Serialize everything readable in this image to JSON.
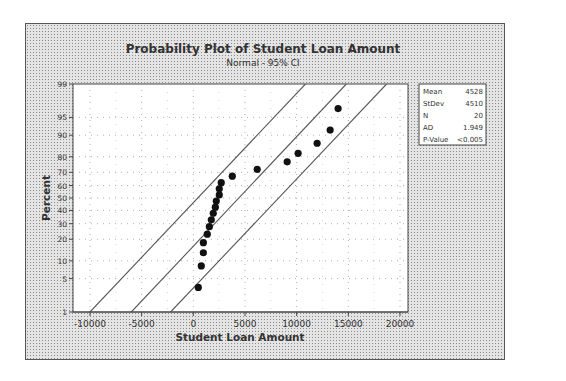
{
  "chart_data": {
    "type": "scatter",
    "title": "Probability Plot of Student Loan Amount",
    "subtitle": "Normal - 95% CI",
    "xlabel": "Student Loan Amount",
    "ylabel": "Percent",
    "xlim": [
      -11000,
      21000
    ],
    "ylim": [
      1,
      99
    ],
    "x_ticks": [
      -10000,
      -5000,
      0,
      5000,
      10000,
      15000,
      20000
    ],
    "x_tick_labels": [
      "-10000",
      "-5000",
      "0",
      "5000",
      "10000",
      "15000",
      "20000"
    ],
    "y_ticks": [
      1,
      5,
      10,
      20,
      30,
      40,
      50,
      60,
      70,
      80,
      90,
      95,
      99
    ],
    "y_tick_labels": [
      "1",
      "5",
      "10",
      "20",
      "30",
      "40",
      "50",
      "60",
      "70",
      "80",
      "90",
      "95",
      "99"
    ],
    "y_scale": "normal probability",
    "grid": true,
    "series": [
      {
        "name": "Student Loan Amount",
        "x": [
          480,
          770,
          970,
          970,
          1350,
          1550,
          1740,
          1930,
          2130,
          2220,
          2510,
          2510,
          2700,
          3770,
          6180,
          9080,
          10140,
          11980,
          13240,
          14010
        ],
        "y": [
          3.4,
          8.3,
          13.2,
          18.1,
          23.0,
          27.9,
          32.8,
          37.7,
          42.6,
          47.5,
          52.5,
          57.4,
          62.3,
          67.2,
          72.1,
          77.0,
          81.9,
          86.8,
          91.7,
          96.6
        ]
      }
    ],
    "fit_line": {
      "name": "Normal fit",
      "points": [
        [
          -6000,
          1
        ],
        [
          14800,
          99
        ]
      ]
    },
    "ci_lower": {
      "name": "95% CI",
      "points": [
        [
          -10000,
          1
        ],
        [
          10850,
          99
        ]
      ]
    },
    "ci_upper": {
      "name": "95% CI",
      "points": [
        [
          -2200,
          1
        ],
        [
          18700,
          99
        ]
      ]
    },
    "legend": {
      "position": "right",
      "entries": [
        {
          "label": "Mean",
          "value": "4528"
        },
        {
          "label": "StDev",
          "value": "4510"
        },
        {
          "label": "N",
          "value": "20"
        },
        {
          "label": "AD",
          "value": "1.949"
        },
        {
          "label": "P-Value",
          "value": "<0.005"
        }
      ]
    }
  }
}
